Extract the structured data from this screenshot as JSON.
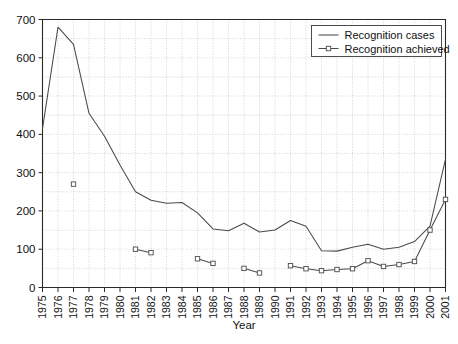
{
  "chart_data": {
    "type": "line",
    "title": "",
    "subtitle": "",
    "xlabel": "Year",
    "ylabel": "",
    "xlim": [
      1975,
      2001
    ],
    "ylim": [
      0,
      700
    ],
    "ytick_step": 100,
    "grid": true,
    "legend_position": "top-right",
    "categories": [
      "1975",
      "1976",
      "1977",
      "1978",
      "1979",
      "1980",
      "1981",
      "1982",
      "1983",
      "1984",
      "1985",
      "1986",
      "1987",
      "1988",
      "1989",
      "1990",
      "1991",
      "1992",
      "1993",
      "1994",
      "1995",
      "1996",
      "1997",
      "1998",
      "1999",
      "2000",
      "2001"
    ],
    "ytick_labels": [
      "0",
      "100",
      "200",
      "300",
      "400",
      "500",
      "600",
      "700"
    ],
    "ytick_values": [
      0,
      100,
      200,
      300,
      400,
      500,
      600,
      700
    ],
    "series": [
      {
        "name": "Recognition cases",
        "marker": "none",
        "color": "#4a4a4a",
        "x": [
          1975,
          1976,
          1977,
          1978,
          1979,
          1980,
          1981,
          1982,
          1983,
          1984,
          1985,
          1986,
          1987,
          1988,
          1989,
          1990,
          1991,
          1992,
          1993,
          1994,
          1995,
          1996,
          1997,
          1998,
          1999,
          2000,
          2001
        ],
        "values": [
          415,
          680,
          635,
          455,
          395,
          320,
          250,
          228,
          220,
          222,
          195,
          153,
          148,
          168,
          145,
          150,
          175,
          160,
          96,
          95,
          105,
          113,
          100,
          105,
          120,
          160,
          335
        ]
      },
      {
        "name": "Recognition achieved",
        "marker": "square",
        "color": "#4a4a4a",
        "segments": [
          {
            "x": [
              1977
            ],
            "values": [
              270
            ]
          },
          {
            "x": [
              1981,
              1982
            ],
            "values": [
              100,
              91
            ]
          },
          {
            "x": [
              1985,
              1986
            ],
            "values": [
              75,
              63
            ]
          },
          {
            "x": [
              1988,
              1989
            ],
            "values": [
              50,
              38
            ]
          },
          {
            "x": [
              1991,
              1992,
              1993,
              1994,
              1995,
              1996,
              1997,
              1998,
              1999,
              2000,
              2001
            ],
            "values": [
              57,
              49,
              44,
              47,
              49,
              70,
              55,
              60,
              68,
              150,
              230
            ]
          }
        ]
      }
    ]
  },
  "legend": {
    "entries": [
      {
        "label": "Recognition cases",
        "marker": "none"
      },
      {
        "label": "Recognition achieved",
        "marker": "square"
      }
    ]
  },
  "axes": {
    "x_title": "Year"
  }
}
